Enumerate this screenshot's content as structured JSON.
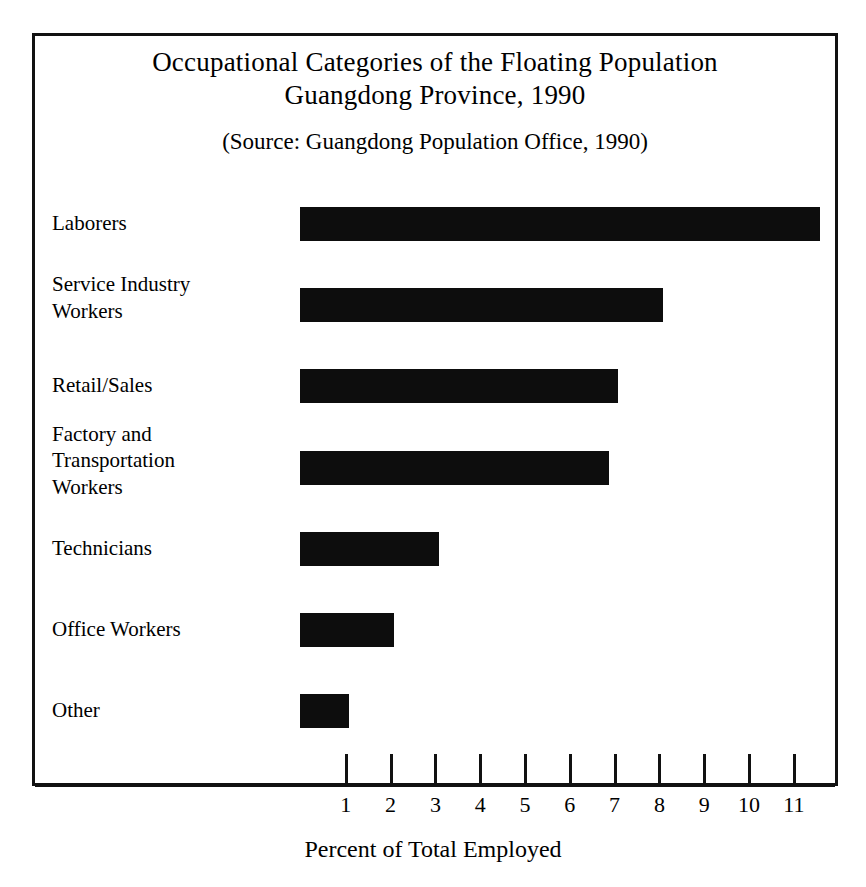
{
  "figure": {
    "title_lines": [
      "Occupational Categories of the Floating Population",
      "Guangdong Province, 1990"
    ],
    "source": "(Source:  Guangdong Population Office, 1990)",
    "frame_color": "#111111",
    "bar_color": "#0d0d0d",
    "background": "#ffffff"
  },
  "chart_data": {
    "type": "bar",
    "orientation": "horizontal",
    "title": "Occupational Categories of the Floating Population Guangdong Province, 1990",
    "subtitle": "(Source:  Guangdong Population Office, 1990)",
    "xlabel": "Percent of Total Employed",
    "ylabel": "",
    "categories": [
      "Laborers",
      "Service Industry Workers",
      "Retail/Sales",
      "Factory and Transportation Workers",
      "Technicians",
      "Office Workers",
      "Other"
    ],
    "category_label_lines": [
      [
        "Laborers"
      ],
      [
        "Service Industry",
        "Workers"
      ],
      [
        "Retail/Sales"
      ],
      [
        "Factory and",
        "Transportation",
        "Workers"
      ],
      [
        "Technicians"
      ],
      [
        "Office Workers"
      ],
      [
        "Other"
      ]
    ],
    "values": [
      11.6,
      8.1,
      7.1,
      6.9,
      3.1,
      2.1,
      1.1
    ],
    "xlim": [
      0,
      12
    ],
    "xticks": [
      1,
      2,
      3,
      4,
      5,
      6,
      7,
      8,
      9,
      10,
      11
    ],
    "xtick_labels": [
      "1",
      "2",
      "3",
      "4",
      "5",
      "6",
      "7",
      "8",
      "9",
      "10",
      "11"
    ],
    "grid": false,
    "legend": false
  }
}
